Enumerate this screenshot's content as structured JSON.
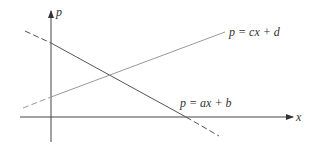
{
  "diagram": {
    "type": "supply-demand-lines",
    "axes": {
      "x_label": "x",
      "y_label": "p"
    },
    "lines": [
      {
        "id": "falling",
        "equation": "p = ax + b",
        "color": "#555555"
      },
      {
        "id": "rising",
        "equation": "p = cx + d",
        "color": "#999999"
      }
    ],
    "colors": {
      "axis": "#444444",
      "background": "#ffffff"
    }
  }
}
